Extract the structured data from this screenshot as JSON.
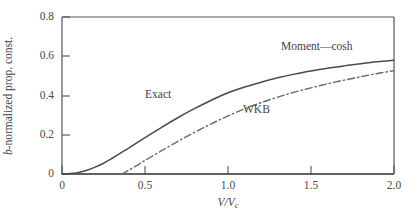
{
  "figure": {
    "background_color": "#ffffff",
    "axis_color": "#555555",
    "curve_color": "#4a4a4a"
  },
  "chart_data": {
    "type": "line",
    "title": "",
    "subtitle": "",
    "xlabel": "V/Vc",
    "xlabel_parts": {
      "main": "V/V",
      "sub": "c"
    },
    "ylabel": "b-normalized prop. const.",
    "ylabel_parts": {
      "italic": "b",
      "rest": "-normalized prop. const."
    },
    "xlim": [
      0,
      2.0
    ],
    "ylim": [
      0,
      0.8
    ],
    "xticks": [
      0,
      0.5,
      1.0,
      1.5,
      2.0
    ],
    "xticklabels": [
      "0",
      "0.5",
      "1.0",
      "1.5",
      "2.0"
    ],
    "yticks": [
      0,
      0.2,
      0.4,
      0.6,
      0.8
    ],
    "yticklabels": [
      "0",
      "0.2",
      "0.4",
      "0.6",
      "0.8"
    ],
    "grid": false,
    "legend": "inline-annotations",
    "annotations": [
      {
        "text": "Exact",
        "x": 0.5,
        "y": 0.435
      },
      {
        "text": "Moment—cosh",
        "x": 1.32,
        "y": 0.685
      },
      {
        "text": "WKB",
        "x": 1.09,
        "y": 0.355
      }
    ],
    "series": [
      {
        "name": "Exact",
        "style": "solid",
        "x": [
          0.0,
          0.05,
          0.1,
          0.15,
          0.2,
          0.25,
          0.3,
          0.35,
          0.4,
          0.45,
          0.5,
          0.6,
          0.7,
          0.8,
          0.9,
          1.0,
          1.1,
          1.2,
          1.3,
          1.4,
          1.5,
          1.6,
          1.7,
          1.8,
          1.9,
          2.0
        ],
        "y": [
          0.0,
          0.002,
          0.008,
          0.019,
          0.035,
          0.055,
          0.079,
          0.105,
          0.131,
          0.158,
          0.185,
          0.238,
          0.288,
          0.334,
          0.376,
          0.414,
          0.443,
          0.468,
          0.49,
          0.509,
          0.525,
          0.539,
          0.551,
          0.562,
          0.572,
          0.58
        ]
      },
      {
        "name": "WKB",
        "style": "dash-dot",
        "x": [
          0.36,
          0.4,
          0.45,
          0.5,
          0.55,
          0.6,
          0.7,
          0.8,
          0.9,
          1.0,
          1.1,
          1.2,
          1.3,
          1.4,
          1.5,
          1.6,
          1.7,
          1.8,
          1.9,
          2.0
        ],
        "y": [
          0.0,
          0.018,
          0.043,
          0.069,
          0.094,
          0.119,
          0.167,
          0.213,
          0.256,
          0.296,
          0.332,
          0.364,
          0.392,
          0.417,
          0.439,
          0.46,
          0.478,
          0.496,
          0.512,
          0.527
        ]
      },
      {
        "name": "baseline-zero",
        "style": "solid-flat",
        "x": [
          0.0,
          2.0
        ],
        "y": [
          0.0,
          0.0
        ]
      }
    ]
  }
}
